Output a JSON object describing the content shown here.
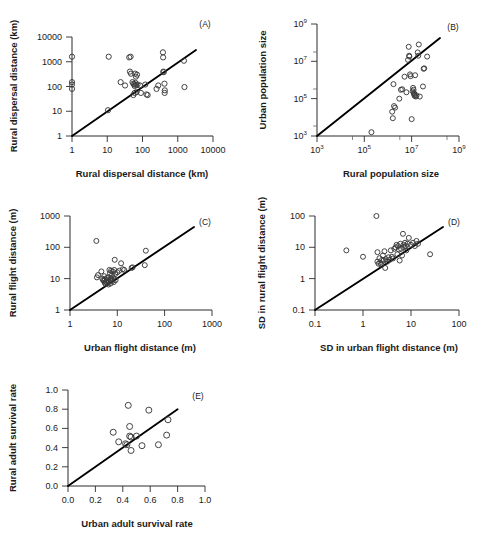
{
  "figure": {
    "title": "",
    "panel_count": 5,
    "marker_style": "open-circle",
    "line_style": "solid-1to1-reference-line",
    "colors": {
      "marker_stroke": "#3a3a3a",
      "line": "#000000",
      "axis": "#2b2b2b",
      "background": "#ffffff"
    }
  },
  "chart_data": [
    {
      "id": "A",
      "tag": "(A)",
      "type": "scatter",
      "title": "",
      "xlabel": "Rural dispersal distance (km)",
      "ylabel": "Rural dispersal distance (km)",
      "xscale": "log",
      "yscale": "log",
      "xlim": [
        1,
        10000
      ],
      "ylim": [
        1,
        10000
      ],
      "xticks": [
        "1",
        "10",
        "100",
        "1000",
        "10000"
      ],
      "yticks": [
        "1",
        "10",
        "100",
        "1000",
        "10000"
      ],
      "grid": false,
      "legend": "none",
      "annotations": [
        "1:1 reference line"
      ],
      "points": [
        [
          1,
          1600
        ],
        [
          1,
          150
        ],
        [
          1,
          120
        ],
        [
          1,
          80
        ],
        [
          10.5,
          11
        ],
        [
          11,
          1600
        ],
        [
          24,
          150
        ],
        [
          32,
          110
        ],
        [
          42,
          1500
        ],
        [
          46,
          1600
        ],
        [
          44,
          400
        ],
        [
          47,
          330
        ],
        [
          52,
          150
        ],
        [
          55,
          130
        ],
        [
          58,
          120
        ],
        [
          60,
          105
        ],
        [
          62,
          330
        ],
        [
          65,
          250
        ],
        [
          63,
          140
        ],
        [
          66,
          115
        ],
        [
          70,
          300
        ],
        [
          72,
          120
        ],
        [
          68,
          60
        ],
        [
          60,
          55
        ],
        [
          55,
          45
        ],
        [
          85,
          110
        ],
        [
          90,
          55
        ],
        [
          120,
          120
        ],
        [
          130,
          48
        ],
        [
          140,
          45
        ],
        [
          250,
          80
        ],
        [
          280,
          110
        ],
        [
          380,
          2400
        ],
        [
          385,
          1500
        ],
        [
          390,
          400
        ],
        [
          400,
          380
        ],
        [
          420,
          130
        ],
        [
          430,
          70
        ],
        [
          425,
          55
        ],
        [
          1500,
          1100
        ],
        [
          1550,
          95
        ]
      ]
    },
    {
      "id": "B",
      "tag": "(B)",
      "type": "scatter",
      "title": "",
      "xlabel": "Rural population size",
      "ylabel": "Urban population size",
      "xscale": "log",
      "yscale": "log",
      "xlim": [
        1000,
        1000000000
      ],
      "ylim": [
        1000,
        1000000000
      ],
      "xticks": [
        "10^3",
        "10^5",
        "10^7",
        "10^9"
      ],
      "yticks": [
        "10^3",
        "10^5",
        "10^7",
        "10^9"
      ],
      "grid": false,
      "legend": "none",
      "annotations": [
        "1:1 reference line"
      ],
      "points": [
        [
          200000,
          1600
        ],
        [
          1500000,
          20000
        ],
        [
          1600000,
          9000
        ],
        [
          1800000,
          40000
        ],
        [
          2000000,
          33000
        ],
        [
          1700000,
          600000
        ],
        [
          3000000,
          100000
        ],
        [
          3500000,
          300000
        ],
        [
          4000000,
          320000
        ],
        [
          5000000,
          1500000
        ],
        [
          6000000,
          220000
        ],
        [
          7000000,
          12000000
        ],
        [
          7500000,
          60000000
        ],
        [
          8000000,
          18000000
        ],
        [
          7800000,
          20000000
        ],
        [
          8500000,
          2000000
        ],
        [
          9000000,
          1600000
        ],
        [
          10000000,
          8000
        ],
        [
          11000000,
          250000
        ],
        [
          11500000,
          380000
        ],
        [
          12000000,
          300000
        ],
        [
          12500000,
          200000
        ],
        [
          13000000,
          160000
        ],
        [
          12800000,
          180000
        ],
        [
          14000000,
          1800000
        ],
        [
          13500000,
          140000
        ],
        [
          15000000,
          130000
        ],
        [
          16000000,
          150000
        ],
        [
          18000000,
          30000000
        ],
        [
          19000000,
          20000000
        ],
        [
          20000000,
          80000000
        ],
        [
          22000000,
          130000
        ],
        [
          30000000,
          450000
        ],
        [
          32000000,
          4000000
        ],
        [
          34000000,
          4200000
        ],
        [
          45000000,
          18000000
        ]
      ]
    },
    {
      "id": "C",
      "tag": "(C)",
      "type": "scatter",
      "title": "",
      "xlabel": "Urban flight distance (m)",
      "ylabel": "Rural flight distance (m)",
      "xscale": "log",
      "yscale": "log",
      "xlim": [
        1,
        1000
      ],
      "ylim": [
        1,
        1000
      ],
      "xticks": [
        "1",
        "10",
        "100",
        "1000"
      ],
      "yticks": [
        "1",
        "10",
        "100",
        "1000"
      ],
      "grid": false,
      "legend": "none",
      "annotations": [
        "1:1 reference line"
      ],
      "points": [
        [
          3.6,
          160
        ],
        [
          3.7,
          11
        ],
        [
          3.9,
          13
        ],
        [
          4.6,
          17
        ],
        [
          4.8,
          10
        ],
        [
          5.0,
          9
        ],
        [
          5.2,
          8.5
        ],
        [
          5.3,
          12
        ],
        [
          5.4,
          7.5
        ],
        [
          5.5,
          9.5
        ],
        [
          5.6,
          6.8
        ],
        [
          5.8,
          8
        ],
        [
          6.0,
          10.5
        ],
        [
          6.1,
          7.2
        ],
        [
          6.2,
          9
        ],
        [
          6.4,
          11
        ],
        [
          6.5,
          6.5
        ],
        [
          6.6,
          8.2
        ],
        [
          6.8,
          19
        ],
        [
          7.0,
          15
        ],
        [
          7.1,
          9.5
        ],
        [
          7.2,
          7
        ],
        [
          7.4,
          18
        ],
        [
          7.5,
          10
        ],
        [
          7.7,
          13
        ],
        [
          7.9,
          8.5
        ],
        [
          8.0,
          17
        ],
        [
          8.2,
          11
        ],
        [
          8.4,
          7.8
        ],
        [
          8.6,
          19
        ],
        [
          8.8,
          40
        ],
        [
          9.0,
          14
        ],
        [
          9.2,
          9
        ],
        [
          10,
          16
        ],
        [
          11,
          18
        ],
        [
          12,
          31
        ],
        [
          13,
          20
        ],
        [
          14,
          19
        ],
        [
          20,
          22
        ],
        [
          21,
          23
        ],
        [
          38,
          27
        ],
        [
          40,
          78
        ]
      ]
    },
    {
      "id": "D",
      "tag": "(D)",
      "type": "scatter",
      "title": "",
      "xlabel": "SD in urban flight distance (m)",
      "ylabel": "SD in rural flight distance (m)",
      "xscale": "log",
      "yscale": "log",
      "xlim": [
        0.1,
        100
      ],
      "ylim": [
        0.1,
        100
      ],
      "xticks": [
        "0.1",
        "1",
        "10",
        "100"
      ],
      "yticks": [
        "0.1",
        "1",
        "10",
        "100"
      ],
      "grid": false,
      "legend": "none",
      "annotations": [
        "1:1 reference line"
      ],
      "points": [
        [
          0.45,
          8
        ],
        [
          1.0,
          5
        ],
        [
          1.9,
          100
        ],
        [
          2.0,
          7
        ],
        [
          2.0,
          3.5
        ],
        [
          2.1,
          3.0
        ],
        [
          2.2,
          4.5
        ],
        [
          2.3,
          3.2
        ],
        [
          2.4,
          2.8
        ],
        [
          2.5,
          4.0
        ],
        [
          2.6,
          5.5
        ],
        [
          2.7,
          3.8
        ],
        [
          2.8,
          7.5
        ],
        [
          2.9,
          2.2
        ],
        [
          3.0,
          4.2
        ],
        [
          3.2,
          3.5
        ],
        [
          3.4,
          4.8
        ],
        [
          3.6,
          4.0
        ],
        [
          3.8,
          8
        ],
        [
          4.0,
          5.0
        ],
        [
          4.2,
          4.4
        ],
        [
          4.5,
          9
        ],
        [
          4.8,
          10
        ],
        [
          5.0,
          12
        ],
        [
          5.2,
          6
        ],
        [
          5.4,
          11
        ],
        [
          5.6,
          8.5
        ],
        [
          5.8,
          3.8
        ],
        [
          6.0,
          13
        ],
        [
          6.2,
          9
        ],
        [
          6.5,
          5.5
        ],
        [
          6.8,
          27
        ],
        [
          7.0,
          12
        ],
        [
          7.2,
          10
        ],
        [
          7.5,
          14
        ],
        [
          7.8,
          11
        ],
        [
          8.0,
          8
        ],
        [
          8.5,
          13
        ],
        [
          9.0,
          20
        ],
        [
          10,
          12
        ],
        [
          11,
          14
        ],
        [
          12,
          11
        ],
        [
          13,
          16
        ],
        [
          14,
          13
        ],
        [
          25,
          6
        ]
      ]
    },
    {
      "id": "E",
      "tag": "(E)",
      "type": "scatter",
      "title": "",
      "xlabel": "Urban adult survival rate",
      "ylabel": "Rural adult survival rate",
      "xscale": "linear",
      "yscale": "linear",
      "xlim": [
        0.0,
        1.0
      ],
      "ylim": [
        0.0,
        1.0
      ],
      "xticks": [
        "0.0",
        "0.2",
        "0.4",
        "0.6",
        "0.8",
        "1.0"
      ],
      "yticks": [
        "0.0",
        "0.2",
        "0.4",
        "0.6",
        "0.8",
        "1.0"
      ],
      "grid": false,
      "legend": "none",
      "annotations": [
        "1:1 reference line"
      ],
      "points": [
        [
          0.33,
          0.56
        ],
        [
          0.37,
          0.46
        ],
        [
          0.42,
          0.44
        ],
        [
          0.43,
          0.43
        ],
        [
          0.44,
          0.84
        ],
        [
          0.45,
          0.62
        ],
        [
          0.45,
          0.52
        ],
        [
          0.46,
          0.51
        ],
        [
          0.46,
          0.37
        ],
        [
          0.5,
          0.52
        ],
        [
          0.54,
          0.42
        ],
        [
          0.59,
          0.79
        ],
        [
          0.66,
          0.43
        ],
        [
          0.72,
          0.53
        ],
        [
          0.73,
          0.69
        ]
      ]
    }
  ]
}
